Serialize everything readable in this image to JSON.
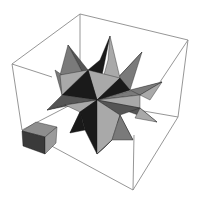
{
  "figure": {
    "title": "Small stellated dodecahedron in bounding box",
    "objects": [
      {
        "name": "bounding-box",
        "kind": "wireframe cube"
      },
      {
        "name": "stellated-polyhedron",
        "kind": "small stellated dodecahedron"
      },
      {
        "name": "small-cube",
        "kind": "solid cube"
      }
    ],
    "colors": {
      "background": "#ffffff",
      "edge": "#8a8a8a",
      "light_face": "#a9a9a9",
      "mid_face": "#7a7a7a",
      "dark_face": "#555555",
      "shadow_face": "#1a1a1a"
    }
  }
}
